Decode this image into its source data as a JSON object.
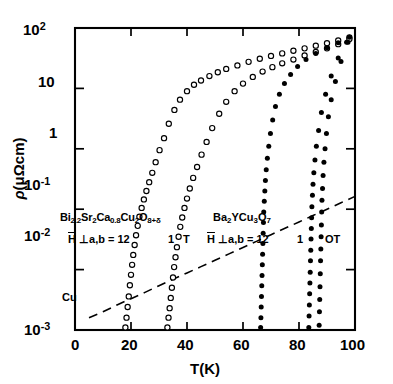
{
  "axes": {
    "xlabel": "T(K)",
    "ylabel_rho": "ρ",
    "ylabel_units": "(μΩcm)",
    "x_ticks": [
      "0",
      "20",
      "40",
      "60",
      "80",
      "100"
    ],
    "y_ticks": [
      "10²",
      "10",
      "1",
      "10⁻¹",
      "10⁻²",
      "10⁻³"
    ]
  },
  "annotations": {
    "bi_formula": "Bi2.2Sr2Ca0.8Cu2O8+δ",
    "bi_field": "H ⊥a,b = 12",
    "bi_field_1t": "1",
    "bi_field_1t_unit": "T",
    "ybco_formula": "Ba2YCu3O7",
    "ybco_field": "H ⊥a,b = 12",
    "ybco_field_1t": "1",
    "ybco_field_0t": "OT",
    "cu_label": "Cu"
  },
  "chart_data": {
    "type": "scatter",
    "title": "",
    "xlabel": "T(K)",
    "ylabel": "ρ(μΩcm)",
    "xlim": [
      0,
      100
    ],
    "ylim": [
      0.001,
      100
    ],
    "yscale": "log",
    "xscale": "linear",
    "grid": false,
    "legend": "none",
    "series": [
      {
        "name": "Bi2.2Sr2Ca0.8Cu2O8+delta, H=12T",
        "marker": "open-circle",
        "field_T": 12,
        "x": [
          18.0,
          18.4,
          18.8,
          19.2,
          19.6,
          20.0,
          20.4,
          20.8,
          21.3,
          21.8,
          22.4,
          23.0,
          23.8,
          24.6,
          25.5,
          26.5,
          27.6,
          28.8,
          30.2,
          31.8,
          33.5,
          35.5,
          37.5,
          40.0,
          42.5,
          45.0,
          48.0,
          51.0,
          54.0,
          58.0,
          62.0,
          66.0,
          70.0,
          74.0,
          78.0,
          82.0,
          86.0,
          90.0,
          94.0,
          98.0
        ],
        "y": [
          0.0011,
          0.0016,
          0.0024,
          0.0036,
          0.0055,
          0.0082,
          0.012,
          0.0175,
          0.0255,
          0.037,
          0.053,
          0.075,
          0.105,
          0.145,
          0.2,
          0.28,
          0.4,
          0.6,
          0.95,
          1.5,
          2.6,
          4.4,
          6.5,
          9.0,
          11.5,
          13.5,
          16.0,
          18.5,
          21.0,
          24.0,
          27.5,
          31.0,
          34.5,
          38.0,
          42.0,
          46.0,
          51.0,
          56.0,
          62.0,
          70.0
        ]
      },
      {
        "name": "Bi2.2Sr2Ca0.8Cu2O8+delta, H=1T",
        "marker": "open-circle",
        "field_T": 1,
        "x": [
          33.0,
          33.4,
          33.8,
          34.2,
          34.6,
          35.0,
          35.4,
          35.9,
          36.4,
          37.0,
          37.6,
          38.3,
          39.1,
          40.0,
          41.0,
          42.2,
          43.6,
          45.2,
          47.0,
          49.0,
          51.5,
          54.0,
          57.0,
          60.0,
          63.5,
          67.0,
          70.5,
          74.0,
          78.0,
          82.0,
          86.0,
          90.0,
          94.0,
          98.0
        ],
        "y": [
          0.0011,
          0.0016,
          0.0023,
          0.0034,
          0.005,
          0.0074,
          0.011,
          0.016,
          0.0235,
          0.035,
          0.051,
          0.073,
          0.105,
          0.15,
          0.22,
          0.33,
          0.5,
          0.8,
          1.3,
          2.2,
          3.8,
          6.0,
          9.0,
          12.0,
          15.5,
          19.0,
          22.5,
          26.0,
          30.0,
          35.0,
          40.0,
          46.0,
          54.0,
          66.0
        ]
      },
      {
        "name": "Ba2YCu3O7, H=12T",
        "marker": "filled-circle",
        "field_T": 12,
        "x": [
          66.3,
          66.4,
          66.5,
          66.6,
          66.7,
          66.8,
          66.9,
          67.0,
          67.1,
          67.2,
          67.3,
          67.4,
          67.6,
          67.8,
          68.0,
          68.3,
          68.7,
          69.2,
          69.8,
          70.6,
          71.6,
          73.0,
          74.8,
          77.0,
          79.5,
          82.5,
          86.0,
          90.0,
          94.0,
          98.0
        ],
        "y": [
          0.0011,
          0.0016,
          0.0024,
          0.0036,
          0.0054,
          0.008,
          0.012,
          0.018,
          0.027,
          0.04,
          0.06,
          0.09,
          0.135,
          0.2,
          0.3,
          0.45,
          0.7,
          1.1,
          1.8,
          3.0,
          5.0,
          8.0,
          12.0,
          17.0,
          23.0,
          30.0,
          38.0,
          47.0,
          57.0,
          70.0
        ]
      },
      {
        "name": "Ba2YCu3O7, H=1T",
        "marker": "filled-circle",
        "field_T": 1,
        "x": [
          83.5,
          83.6,
          83.7,
          83.8,
          83.9,
          84.0,
          84.1,
          84.2,
          84.3,
          84.4,
          84.5,
          84.6,
          84.8,
          85.0,
          85.3,
          85.7,
          86.2,
          87.0,
          88.0,
          89.5,
          91.5,
          94.0,
          97.0
        ],
        "y": [
          0.0011,
          0.0017,
          0.0026,
          0.004,
          0.006,
          0.009,
          0.014,
          0.021,
          0.032,
          0.048,
          0.072,
          0.11,
          0.17,
          0.26,
          0.4,
          0.65,
          1.1,
          2.0,
          4.0,
          8.0,
          16.0,
          32.0,
          58.0
        ]
      },
      {
        "name": "Ba2YCu3O7, H=0T",
        "marker": "filled-circle",
        "field_T": 0,
        "x": [
          87.2,
          87.3,
          87.4,
          87.5,
          87.6,
          87.7,
          87.8,
          87.9,
          88.0,
          88.1,
          88.2,
          88.4,
          88.6,
          88.9,
          89.3,
          89.8,
          90.5,
          91.5,
          93.0,
          95.0,
          97.5
        ],
        "y": [
          0.0012,
          0.002,
          0.0032,
          0.0052,
          0.0085,
          0.014,
          0.022,
          0.035,
          0.055,
          0.09,
          0.14,
          0.22,
          0.36,
          0.6,
          1.0,
          1.8,
          3.4,
          6.5,
          13.0,
          28.0,
          58.0
        ]
      },
      {
        "name": "Cu reference",
        "marker": "dashed-line",
        "x": [
          5,
          10,
          15,
          20,
          25,
          30,
          35,
          40,
          45,
          50,
          55,
          60,
          65,
          70,
          75,
          80,
          85,
          90,
          95,
          100
        ],
        "y": [
          0.0016,
          0.002,
          0.0026,
          0.0033,
          0.0042,
          0.0054,
          0.0069,
          0.0088,
          0.0112,
          0.0143,
          0.0182,
          0.0232,
          0.0296,
          0.0378,
          0.0482,
          0.0615,
          0.0785,
          0.1,
          0.128,
          0.163
        ]
      }
    ]
  }
}
